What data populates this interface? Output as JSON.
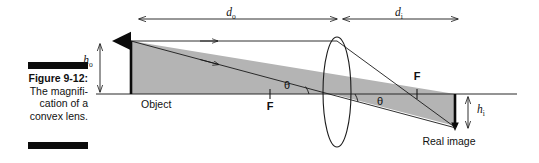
{
  "figure": {
    "caption_title": "Figure 9-12:",
    "caption_lines": [
      "The magnifi-",
      "cation of a",
      "convex lens."
    ],
    "bar_color": "#0b0b0b"
  },
  "diagram": {
    "title": "Magnification of a convex lens ray diagram",
    "labels": {
      "object": "Object",
      "real_image": "Real image",
      "focal_left": "F",
      "focal_right": "F",
      "theta_left": "θ",
      "theta_right": "θ",
      "object_distance": "d",
      "object_distance_sub": "o",
      "image_distance": "d",
      "image_distance_sub": "i",
      "object_height": "h",
      "object_height_sub": "o",
      "image_height": "h",
      "image_height_sub": "i"
    },
    "colors": {
      "line": "#1a1a1a",
      "shade": "#b4b4b4",
      "shade_stroke": "#1a1a1a",
      "axis": "#2b2b2b",
      "arrow_solid": "#0b0b0b"
    },
    "geometry": {
      "axis_y": 94,
      "axis_x_start": 96,
      "axis_x_end": 517,
      "object_x": 131,
      "object_top_y": 39,
      "image_x": 455,
      "image_bottom_y": 126,
      "lens_cx": 337,
      "lens_cy": 92,
      "lens_rx": 14,
      "lens_ry": 55,
      "focal_left_x": 270,
      "focal_right_x": 417,
      "d_o_arrow_y": 19,
      "d_i_arrow_y": 19,
      "h_o_arrow_x": 100,
      "h_i_arrow_x": 468
    }
  }
}
